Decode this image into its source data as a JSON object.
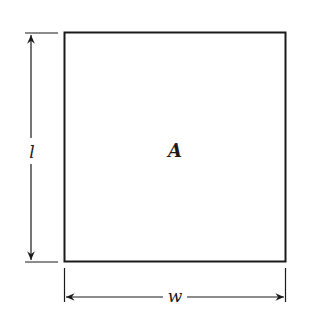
{
  "diagram": {
    "shape": "rectangle",
    "area_label": "A",
    "length_label": "l",
    "width_label": "w",
    "colors": {
      "line": "#1a1a1a",
      "background": "#ffffff"
    }
  }
}
